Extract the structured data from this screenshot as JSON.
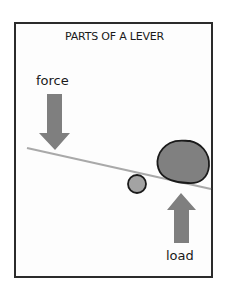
{
  "title": "PARTS OF A LEVER",
  "labels": {
    "force": "force",
    "load": "load"
  },
  "colors": {
    "frame": "#2b2b2b",
    "arrow_fill": "#7f7f7f",
    "lever_line": "#a9a9a9",
    "fulcrum_fill": "#a3a3a3",
    "load_fill": "#808080",
    "outline": "#1a1a1a"
  },
  "parts": [
    "force",
    "lever",
    "fulcrum",
    "load"
  ]
}
